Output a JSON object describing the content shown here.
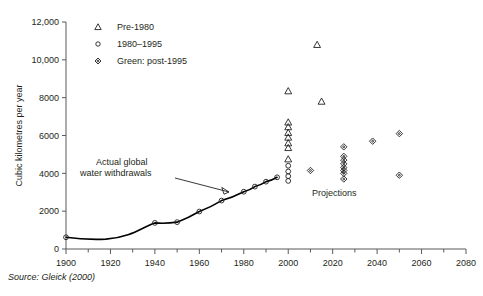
{
  "figure": {
    "source_note": "Source: Gleick (2000)"
  },
  "annotations": {
    "actual_line1": "Actual global",
    "actual_line2": "water withdrawals",
    "projections": "Projections"
  },
  "chart_data": {
    "type": "scatter",
    "title": "",
    "xlabel": "",
    "ylabel": "Cubic kilometres per year",
    "xlim": [
      1900,
      2080
    ],
    "ylim": [
      0,
      12000
    ],
    "grid": false,
    "legend_position": "top-left",
    "x_ticks": [
      1900,
      1920,
      1940,
      1960,
      1980,
      2000,
      2020,
      2040,
      2060,
      2080
    ],
    "x_tick_labels": [
      "1900",
      "1920",
      "1940",
      "1960",
      "1980",
      "2000",
      "2020",
      "2040",
      "2060",
      "2080"
    ],
    "x_minor_ticks": [
      1910,
      1930,
      1950,
      1970,
      1990,
      2010,
      2030,
      2050,
      2070
    ],
    "y_ticks": [
      0,
      2000,
      4000,
      6000,
      8000,
      10000,
      12000
    ],
    "y_tick_labels": [
      "0",
      "2000",
      "4000",
      "6000",
      "8000",
      "10,000",
      "12,000"
    ],
    "legend": [
      {
        "marker": "triangle",
        "label": "Pre-1980"
      },
      {
        "marker": "circle",
        "label": "1980–1995"
      },
      {
        "marker": "diamond",
        "label": "Green: post-1995"
      }
    ],
    "series": [
      {
        "name": "Actual global water withdrawals",
        "marker": "circle",
        "line": true,
        "x": [
          1900,
          1940,
          1950,
          1960,
          1970,
          1980,
          1985,
          1990,
          1995
        ],
        "values": [
          620,
          1380,
          1420,
          1980,
          2560,
          3030,
          3300,
          3560,
          3790
        ]
      },
      {
        "name": "Pre-1980 projections",
        "marker": "triangle",
        "line": false,
        "x": [
          2000,
          2000,
          2000,
          2000,
          2000,
          2000,
          2000,
          2000,
          2013,
          2015
        ],
        "values": [
          8350,
          6700,
          6450,
          6150,
          5900,
          5600,
          5350,
          4750,
          10800,
          7800
        ]
      },
      {
        "name": "1980–1995 projections",
        "marker": "circle",
        "line": false,
        "x": [
          2000,
          2000,
          2000,
          2000
        ],
        "values": [
          4400,
          4100,
          3850,
          3600
        ]
      },
      {
        "name": "Green: post-1995 projections",
        "marker": "diamond",
        "line": false,
        "x": [
          2010,
          2025,
          2025,
          2025,
          2025,
          2025,
          2025,
          2025,
          2025,
          2038,
          2050,
          2050
        ],
        "values": [
          4150,
          5400,
          4900,
          4700,
          4500,
          4300,
          4150,
          4000,
          3700,
          5700,
          6100,
          3900
        ]
      }
    ]
  }
}
